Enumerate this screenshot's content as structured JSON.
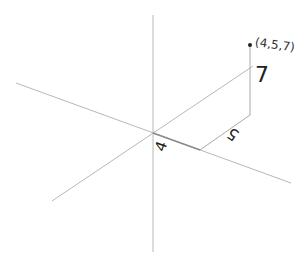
{
  "diagram": {
    "type": "3d-coordinate-point",
    "point": {
      "label": "(4,5,7)",
      "coordinates": {
        "x": 4,
        "y": 5,
        "z": 7
      },
      "color": "#222222"
    },
    "labels": {
      "x_length": "4",
      "y_length": "5",
      "z_length": "7"
    },
    "colors": {
      "axis": "#b8b8b8",
      "guide": "#a8a8a8",
      "text": "#222222"
    }
  }
}
